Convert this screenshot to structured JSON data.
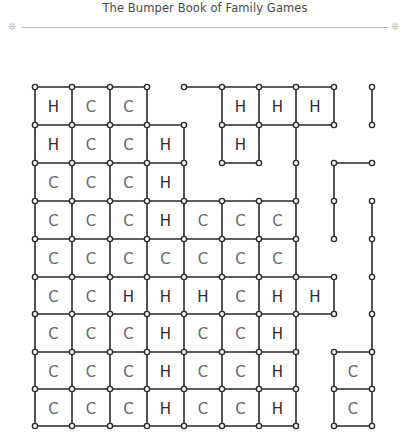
{
  "header": {
    "title": "The Bumper Book of Family Games",
    "flourish_icon": "snowflake-dots-icon"
  },
  "board": {
    "description": "Hand-drawn dots-and-boxes style grid with letters H and C in completed squares",
    "grid_x": [
      35,
      72,
      110,
      147,
      184,
      222,
      259,
      296,
      334,
      372
    ],
    "grid_y": [
      87,
      125,
      163,
      201,
      239,
      277,
      314,
      352,
      389,
      426
    ],
    "cells": [
      [
        "H",
        "C",
        "C",
        "",
        "",
        "H",
        "H",
        "H",
        ""
      ],
      [
        "H",
        "C",
        "C",
        "H",
        "",
        "H",
        "",
        "",
        ""
      ],
      [
        "C",
        "C",
        "C",
        "H",
        "",
        "",
        "",
        "",
        ""
      ],
      [
        "C",
        "C",
        "C",
        "H",
        "C",
        "C",
        "C",
        "",
        ""
      ],
      [
        "C",
        "C",
        "C",
        "C",
        "C",
        "C",
        "C",
        "",
        ""
      ],
      [
        "C",
        "C",
        "H",
        "H",
        "H",
        "C",
        "H",
        "H",
        ""
      ],
      [
        "C",
        "C",
        "C",
        "H",
        "C",
        "C",
        "H",
        "",
        ""
      ],
      [
        "C",
        "C",
        "C",
        "H",
        "C",
        "C",
        "H",
        "",
        "C"
      ],
      [
        "C",
        "C",
        "C",
        "H",
        "C",
        "C",
        "H",
        "",
        "C"
      ]
    ],
    "extra_segments": [
      [
        [
          184,
          87
        ],
        [
          222,
          87
        ]
      ],
      [
        [
          372,
          87
        ],
        [
          372,
          125
        ]
      ],
      [
        [
          296,
          125
        ],
        [
          296,
          201
        ]
      ],
      [
        [
          334,
          163
        ],
        [
          372,
          163
        ]
      ],
      [
        [
          334,
          163
        ],
        [
          334,
          239
        ]
      ],
      [
        [
          372,
          201
        ],
        [
          372,
          426
        ]
      ]
    ],
    "colors": {
      "line": "#2a2a2a",
      "letter_h": "#2b2b2b",
      "letter_c": "#6a6a6a"
    }
  }
}
